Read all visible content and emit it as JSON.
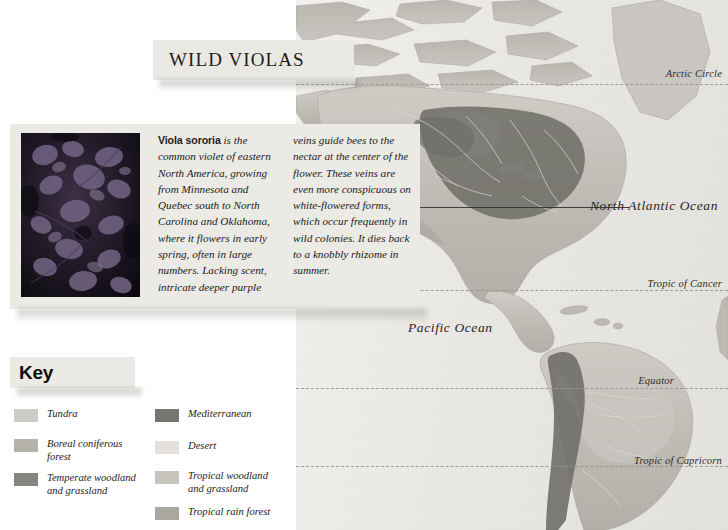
{
  "page": {
    "title": "WILD VIOLAS"
  },
  "info_card": {
    "photo_alt": "viola-sororia-photo",
    "column1_lead": "Viola sororia",
    "column1_text": " is the common violet of eastern North America, growing from Minnesota and Quebec south to North Carolina and Oklahoma, where it flowers in early spring, often in large numbers. Lacking scent, intricate deeper purple",
    "column2_text": "veins guide bees to the nectar at the center of the flower. These veins are even more conspicuous on white-flowered forms, which occur frequently in wild colonies. It dies back to a knobbly rhizome in summer."
  },
  "key": {
    "heading": "Key",
    "left_items": [
      {
        "label": "Tundra",
        "color": "#cdcbc5"
      },
      {
        "label": "Boreal coniferous\nforest",
        "color": "#b4b2ab"
      },
      {
        "label": "Temperate woodland\nand grassland",
        "color": "#86857f"
      }
    ],
    "right_items": [
      {
        "label": "Mediterranean",
        "color": "#76756f"
      },
      {
        "label": "Desert",
        "color": "#e3e1da"
      },
      {
        "label": "Tropical woodland\nand grassland",
        "color": "#c6c4bd"
      },
      {
        "label": "Tropical rain forest",
        "color": "#a9a7a0"
      }
    ]
  },
  "map": {
    "latitude_lines": [
      {
        "name": "Arctic Circle",
        "label": "Arctic Circle"
      },
      {
        "name": "Tropic of Cancer",
        "label": "Tropic of Cancer"
      },
      {
        "name": "Equator",
        "label": "Equator"
      },
      {
        "name": "Tropic of Capricorn",
        "label": "Tropic of Capricorn"
      }
    ],
    "ocean_labels": [
      {
        "name": "north-atlantic",
        "lines": "North\nAtlantic\nOcean"
      },
      {
        "name": "pacific",
        "lines": "Pacific\nOcean"
      }
    ],
    "colors": {
      "sea": "#eae8e4",
      "land": "#bebcb5",
      "distribution": "#74736d",
      "lat_line": "#9a9790"
    }
  }
}
